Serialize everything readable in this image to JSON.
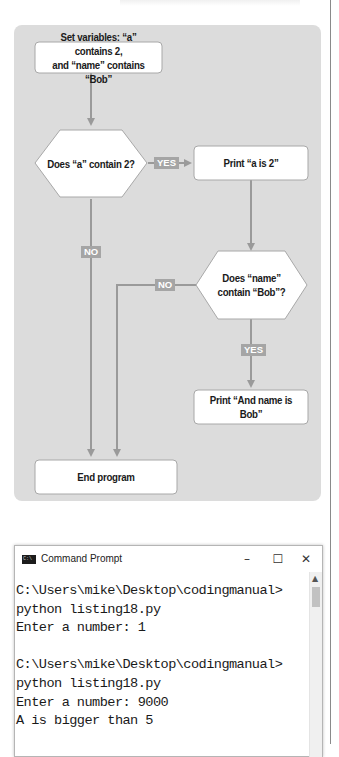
{
  "flowchart": {
    "start": "Set variables: “a” contains 2,\nand “name” contains “Bob”",
    "start_line1": "Set variables: “a” contains 2,",
    "start_line2": "and “name” contains “Bob”",
    "decision1": "Does “a” contain 2?",
    "print_a": "Print “a is 2”",
    "decision2_line1": "Does “name”",
    "decision2_line2": "contain “Bob”?",
    "print_name": "Print “And name is Bob”",
    "end": "End program",
    "labels": {
      "yes1": "YES",
      "no1": "NO",
      "no2": "NO",
      "yes2": "YES"
    },
    "colors": {
      "panel": "#dcdcdc",
      "connector": "#9a9a9a",
      "tag": "#a5a5a5",
      "node_fill": "#ffffff"
    }
  },
  "terminal": {
    "title": "Command Prompt",
    "icon": "cmd-icon",
    "controls": {
      "minimize": "–",
      "maximize": "☐",
      "close": "✕"
    },
    "lines": [
      "C:\\Users\\mike\\Desktop\\codingmanual>",
      "python listing18.py",
      "Enter a number: 1",
      "",
      "C:\\Users\\mike\\Desktop\\codingmanual>",
      "python listing18.py",
      "Enter a number: 9000",
      "A is bigger than 5"
    ]
  }
}
